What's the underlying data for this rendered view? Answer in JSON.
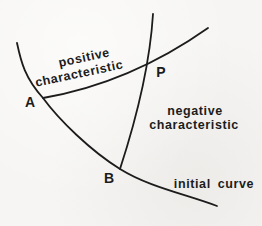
{
  "window": {
    "width_px": 262,
    "height_px": 226,
    "description": "Hand-drawn textbook diagram of characteristic curves for a hyperbolic PDE"
  },
  "colors": {
    "paper_background": "#f6f5f3",
    "ink": "#1c1c1c"
  },
  "diagram": {
    "labels": {
      "positive_line1": "positive",
      "positive_line2": "characteristic",
      "negative_line1": "negative",
      "negative_line2": "characteristic",
      "initial_curve": "initial curve"
    },
    "points": {
      "a": "A",
      "b": "B",
      "p": "P"
    },
    "curves": {
      "initial_curve_path": "M17,43 C21,62 25,78 43,98 C59,120 91,151 120,169 C149,187 185,194 217,206",
      "positive_characteristic_path": "M43,98 Q130,83 208,28",
      "negative_characteristic_path": "M153,14 Q149,80 120,169"
    }
  }
}
